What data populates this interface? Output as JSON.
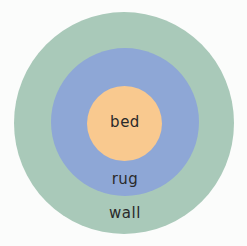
{
  "diagram": {
    "type": "concentric-circles",
    "layers": [
      {
        "id": "wall",
        "label": "wall",
        "color": "#a9c9b9",
        "level": "outer"
      },
      {
        "id": "rug",
        "label": "rug",
        "color": "#8ea7d6",
        "level": "middle"
      },
      {
        "id": "bed",
        "label": "bed",
        "color": "#f9c98f",
        "level": "inner"
      }
    ],
    "text_color": "#2a2a2a",
    "background": "#fbfcfb"
  }
}
